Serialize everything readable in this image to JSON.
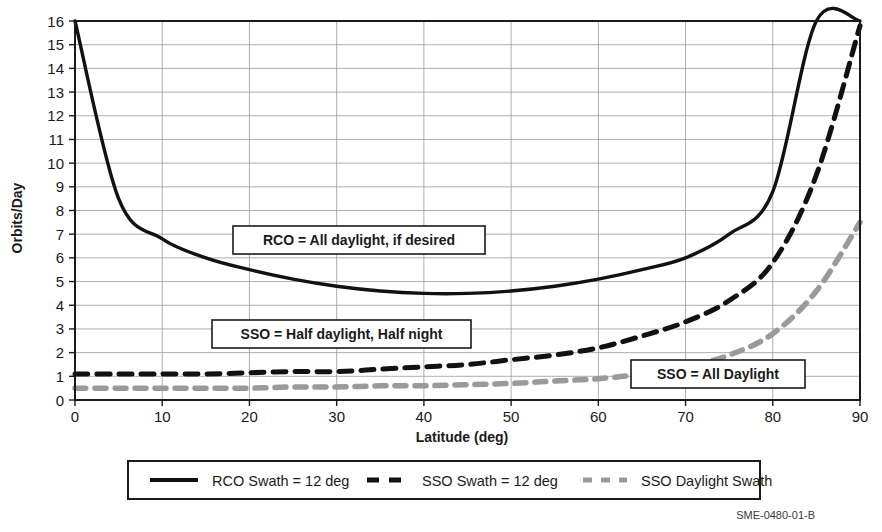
{
  "chart_data": {
    "type": "line",
    "title": "",
    "xlabel": "Latitude (deg)",
    "ylabel": "Orbits/Day",
    "xlim": [
      0,
      90
    ],
    "ylim": [
      0,
      16
    ],
    "xticks": [
      0,
      10,
      20,
      30,
      40,
      50,
      60,
      70,
      80,
      90
    ],
    "yticks": [
      0,
      1,
      2,
      3,
      4,
      5,
      6,
      7,
      8,
      9,
      10,
      11,
      12,
      13,
      14,
      15,
      16
    ],
    "grid": true,
    "legend_position": "below-axes",
    "series": [
      {
        "name": "RCO Swath = 12 deg",
        "color": "#111111",
        "style": "solid",
        "x": [
          0,
          5,
          10,
          15,
          20,
          25,
          30,
          35,
          40,
          45,
          50,
          55,
          60,
          65,
          70,
          75,
          80,
          85,
          90
        ],
        "values": [
          16.0,
          8.5,
          6.8,
          6.0,
          5.5,
          5.1,
          4.8,
          4.6,
          4.5,
          4.5,
          4.6,
          4.8,
          5.1,
          5.5,
          6.0,
          7.0,
          8.8,
          16.0,
          16.0
        ]
      },
      {
        "name": "SSO Swath = 12 deg",
        "color": "#111111",
        "style": "dashed",
        "x": [
          0,
          5,
          10,
          15,
          20,
          25,
          30,
          35,
          40,
          45,
          50,
          55,
          60,
          65,
          70,
          75,
          80,
          85,
          90
        ],
        "values": [
          1.1,
          1.1,
          1.1,
          1.1,
          1.15,
          1.2,
          1.2,
          1.3,
          1.4,
          1.5,
          1.7,
          1.9,
          2.2,
          2.7,
          3.3,
          4.2,
          5.8,
          9.5,
          15.8
        ]
      },
      {
        "name": "SSO Daylight Swath",
        "color": "#9a9a9a",
        "style": "dashed",
        "x": [
          0,
          5,
          10,
          15,
          20,
          25,
          30,
          35,
          40,
          45,
          50,
          55,
          60,
          65,
          70,
          75,
          80,
          85,
          90
        ],
        "values": [
          0.5,
          0.5,
          0.5,
          0.5,
          0.5,
          0.55,
          0.55,
          0.6,
          0.6,
          0.65,
          0.7,
          0.8,
          0.9,
          1.1,
          1.4,
          1.9,
          2.8,
          4.6,
          7.5
        ]
      }
    ],
    "annotations": [
      {
        "id": "rco-all-daylight",
        "text": "RCO = All daylight, if desired"
      },
      {
        "id": "sso-half-daylight",
        "text": "SSO = Half daylight, Half night"
      },
      {
        "id": "sso-all-daylight",
        "text": "SSO = All Daylight"
      }
    ]
  },
  "axes": {
    "x_title": "Latitude (deg)",
    "y_title": "Orbits/Day",
    "x_tick_labels": [
      "0",
      "10",
      "20",
      "30",
      "40",
      "50",
      "60",
      "70",
      "80",
      "90"
    ],
    "y_tick_labels": [
      "0",
      "1",
      "2",
      "3",
      "4",
      "5",
      "6",
      "7",
      "8",
      "9",
      "10",
      "11",
      "12",
      "13",
      "14",
      "15",
      "16"
    ]
  },
  "annotations": {
    "rco": "RCO = All daylight, if desired",
    "sso_half": "SSO = Half daylight, Half night",
    "sso_all": "SSO = All Daylight"
  },
  "legend": {
    "items": [
      {
        "label": "RCO Swath = 12 deg",
        "color": "#111111",
        "style": "solid"
      },
      {
        "label": "SSO Swath = 12 deg",
        "color": "#111111",
        "style": "dashed"
      },
      {
        "label": "SSO Daylight Swath",
        "color": "#9a9a9a",
        "style": "dashed"
      }
    ]
  },
  "caption": {
    "text": "SME-0480-01-B"
  },
  "colors": {
    "rco": "#111111",
    "sso": "#111111",
    "sso_daylight": "#9a9a9a",
    "grid": "#9a9a9a",
    "frame": "#1a1a1a"
  }
}
